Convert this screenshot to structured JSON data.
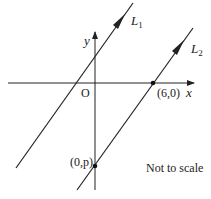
{
  "diagram": {
    "axes": {
      "x_label": "x",
      "y_label": "y",
      "origin_label": "O"
    },
    "lines": [
      {
        "name": "L",
        "subscript": "1"
      },
      {
        "name": "L",
        "subscript": "2"
      }
    ],
    "points": [
      {
        "label": "(6,0)"
      },
      {
        "label": "(0,p)"
      }
    ],
    "note": "Not to scale",
    "colors": {
      "ink": "#222222",
      "background": "#ffffff"
    }
  }
}
